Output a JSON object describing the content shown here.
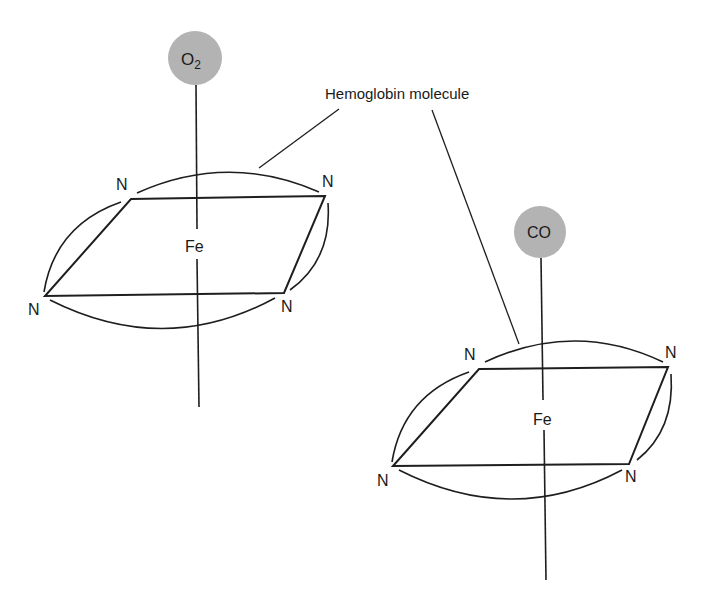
{
  "diagram": {
    "callout_label": "Hemoglobin molecule",
    "molecule_left": {
      "ligand": "O",
      "ligand_subscript": "2",
      "center_atom": "Fe",
      "nitrogens": [
        "N",
        "N",
        "N",
        "N"
      ]
    },
    "molecule_right": {
      "ligand": "CO",
      "center_atom": "Fe",
      "nitrogens": [
        "N",
        "N",
        "N",
        "N"
      ]
    },
    "colors": {
      "ligand_fill": "#b3b3b3",
      "line": "#1e1e1e",
      "background": "#ffffff"
    }
  }
}
